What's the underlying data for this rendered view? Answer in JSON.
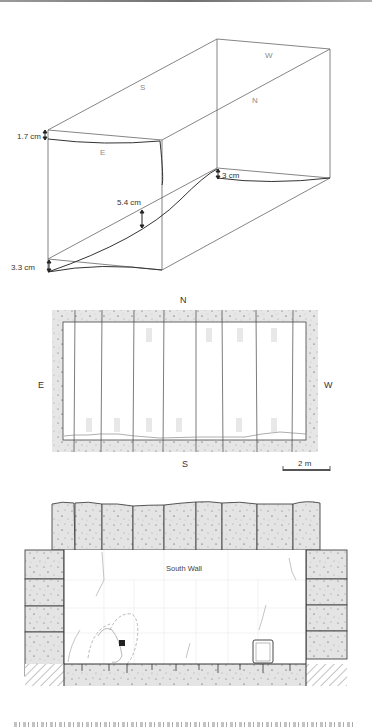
{
  "figure": {
    "isometric": {
      "face_labels": {
        "south": "S",
        "west": "W",
        "north": "N",
        "east": "E"
      },
      "measurements": [
        {
          "id": "east-top",
          "label": "1.7 cm"
        },
        {
          "id": "middle",
          "label": "5.4 cm"
        },
        {
          "id": "west-bottom",
          "label": "3 cm"
        },
        {
          "id": "east-bottom",
          "label": "3.3 cm"
        }
      ]
    },
    "plan": {
      "compass": {
        "north": "N",
        "south": "S",
        "east": "E",
        "west": "W"
      },
      "scale_bar": "2 m"
    },
    "elevation": {
      "title": "South Wall"
    },
    "colors": {
      "line": "#333333",
      "faint_line": "#9a9a9a",
      "stone_fill": "#e4e4e4",
      "label_gray": "#8a8a8a"
    }
  }
}
